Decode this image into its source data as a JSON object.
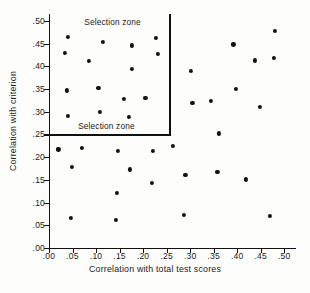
{
  "chart_data": {
    "type": "scatter",
    "title": "",
    "xlabel": "Correlation with total test scores",
    "ylabel": "Correlation with criterion",
    "xlim": [
      0.0,
      0.525
    ],
    "ylim": [
      0.0,
      0.515
    ],
    "xticks": [
      0.0,
      0.05,
      0.1,
      0.15,
      0.2,
      0.25,
      0.3,
      0.35,
      0.4,
      0.45,
      0.5
    ],
    "xticklabels": [
      ".00",
      ".05",
      ".10",
      ".15",
      ".20",
      ".25",
      ".30",
      ".35",
      ".40",
      ".45",
      ".50"
    ],
    "yticks": [
      0.0,
      0.05,
      0.1,
      0.15,
      0.2,
      0.25,
      0.3,
      0.35,
      0.4,
      0.45,
      0.5
    ],
    "yticklabels": [
      ".00",
      ".05",
      ".10",
      ".15",
      ".20",
      ".25",
      ".30",
      ".35",
      ".40",
      ".45",
      ".50"
    ],
    "grid": false,
    "legend": false,
    "marker": "filled-circle",
    "marker_color": "#111111",
    "points": [
      {
        "x": 0.02,
        "y": 0.217
      },
      {
        "x": 0.033,
        "y": 0.43
      },
      {
        "x": 0.04,
        "y": 0.465
      },
      {
        "x": 0.038,
        "y": 0.347
      },
      {
        "x": 0.041,
        "y": 0.291
      },
      {
        "x": 0.046,
        "y": 0.067
      },
      {
        "x": 0.049,
        "y": 0.178
      },
      {
        "x": 0.07,
        "y": 0.22
      },
      {
        "x": 0.085,
        "y": 0.411
      },
      {
        "x": 0.105,
        "y": 0.352
      },
      {
        "x": 0.108,
        "y": 0.3
      },
      {
        "x": 0.115,
        "y": 0.454
      },
      {
        "x": 0.142,
        "y": 0.062
      },
      {
        "x": 0.144,
        "y": 0.121
      },
      {
        "x": 0.146,
        "y": 0.214
      },
      {
        "x": 0.16,
        "y": 0.328
      },
      {
        "x": 0.17,
        "y": 0.288
      },
      {
        "x": 0.172,
        "y": 0.173
      },
      {
        "x": 0.176,
        "y": 0.446
      },
      {
        "x": 0.177,
        "y": 0.395
      },
      {
        "x": 0.205,
        "y": 0.33
      },
      {
        "x": 0.218,
        "y": 0.143
      },
      {
        "x": 0.22,
        "y": 0.214
      },
      {
        "x": 0.228,
        "y": 0.463
      },
      {
        "x": 0.232,
        "y": 0.428
      },
      {
        "x": 0.263,
        "y": 0.225
      },
      {
        "x": 0.287,
        "y": 0.072
      },
      {
        "x": 0.29,
        "y": 0.161
      },
      {
        "x": 0.302,
        "y": 0.389
      },
      {
        "x": 0.305,
        "y": 0.32
      },
      {
        "x": 0.344,
        "y": 0.323
      },
      {
        "x": 0.358,
        "y": 0.167
      },
      {
        "x": 0.362,
        "y": 0.252
      },
      {
        "x": 0.392,
        "y": 0.448
      },
      {
        "x": 0.398,
        "y": 0.35
      },
      {
        "x": 0.418,
        "y": 0.151
      },
      {
        "x": 0.437,
        "y": 0.413
      },
      {
        "x": 0.448,
        "y": 0.311
      },
      {
        "x": 0.47,
        "y": 0.07
      },
      {
        "x": 0.478,
        "y": 0.419
      },
      {
        "x": 0.481,
        "y": 0.478
      }
    ],
    "annotations": {
      "selection_zone_boundary": {
        "vertical_x": 0.255,
        "horizontal_y": 0.25,
        "description": "L-shaped boundary enclosing the upper-left region"
      },
      "labels": [
        {
          "text": "Selection zone",
          "x": 0.075,
          "y": 0.497
        },
        {
          "text": "Selection zone",
          "x": 0.062,
          "y": 0.268
        }
      ]
    }
  },
  "caption": {
    "text": ""
  }
}
